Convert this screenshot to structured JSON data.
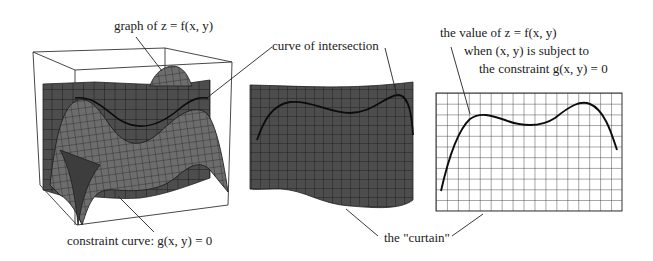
{
  "figure": {
    "panels": [
      {
        "id": "surface",
        "description": "3D graph of z = f(x, y) intersected by the curtain above the constraint curve"
      },
      {
        "id": "curtain",
        "description": "the curtain with the curve of intersection drawn on it"
      },
      {
        "id": "flattened",
        "description": "the curtain flattened showing z = f(x, y) along the constraint"
      }
    ],
    "labels": {
      "graph": "graph of z = f(x, y)",
      "curve_of_intersection": "curve of intersection",
      "constraint_curve": "constraint curve: g(x, y) = 0",
      "curtain": "the \"curtain\"",
      "value_line1": "the value of z = f(x, y)",
      "value_line2": "when (x, y) is subject to",
      "value_line3": "the constraint g(x, y) = 0"
    },
    "colors": {
      "surface_fill": "#6a6a6a",
      "curtain_fill": "#4a4a4a",
      "grid_line": "#1e1e1e",
      "curve": "#111111",
      "background": "#ffffff"
    }
  }
}
